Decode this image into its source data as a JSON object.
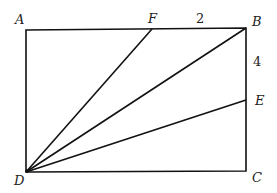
{
  "diagram": {
    "type": "geometry",
    "shape": "rectangle ABCD with segments from D",
    "points": {
      "A": {
        "label": "A",
        "x": 26,
        "y": 30
      },
      "F": {
        "label": "F",
        "x": 152,
        "y": 29
      },
      "B": {
        "label": "B",
        "x": 246,
        "y": 28
      },
      "E": {
        "label": "E",
        "x": 246,
        "y": 100
      },
      "C": {
        "label": "C",
        "x": 246,
        "y": 171
      },
      "D": {
        "label": "D",
        "x": 26,
        "y": 172
      }
    },
    "segments": [
      "AB",
      "BC",
      "CD",
      "DA",
      "DF",
      "DB",
      "DE"
    ],
    "measurements": {
      "FB": "2",
      "BE": "4"
    }
  }
}
